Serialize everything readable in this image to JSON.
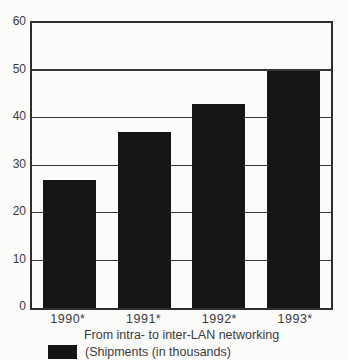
{
  "figure": {
    "background": "#fbfbfa",
    "caption": "From intra- to inter-LAN networking",
    "legend": {
      "swatch_color": "#151515",
      "label": "(Shipments (in thousands)"
    }
  },
  "chart_data": {
    "type": "bar",
    "categories": [
      "1990*",
      "1991*",
      "1992*",
      "1993*"
    ],
    "values": [
      27,
      37,
      43,
      50
    ],
    "title": "",
    "xlabel": "From intra- to inter-LAN networking",
    "ylabel": "",
    "ylim": [
      0,
      60
    ],
    "yticks": [
      0,
      10,
      20,
      30,
      40,
      50,
      60
    ],
    "grid": true,
    "legend_entries": [
      "(Shipments (in thousands)"
    ],
    "legend_position": "bottom-left",
    "bar_color": "#151515",
    "axis_color": "#2d2d2d",
    "text_color": "#3a3a3a"
  }
}
